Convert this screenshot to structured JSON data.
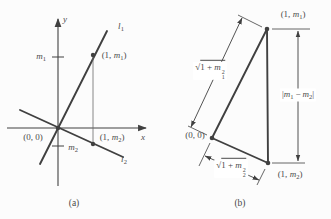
{
  "colors": {
    "ink": "#404040",
    "txt": "#4a4a4a",
    "bg": "#fcfcfc",
    "thin": "#6a6a6a"
  },
  "figure_a": {
    "caption": "(a)",
    "y_axis_label": "y",
    "x_axis_label": "x",
    "l1_label": {
      "letter": "l",
      "sub": "1"
    },
    "l2_label": {
      "letter": "l",
      "sub": "2"
    },
    "m1_tick_label": {
      "letter": "m",
      "sub": "1"
    },
    "m2_tick_label": {
      "letter": "m",
      "sub": "2"
    },
    "origin_label": "(0, 0)",
    "p1_label": {
      "pre": "(1, ",
      "letter": "m",
      "sub": "1",
      "post": ")"
    },
    "p2_label": {
      "pre": "(1, ",
      "letter": "m",
      "sub": "2",
      "post": ")"
    }
  },
  "figure_b": {
    "caption": "(b)",
    "origin_label": "(0, 0)",
    "p1_label": {
      "pre": "(1, ",
      "letter": "m",
      "sub": "1",
      "post": ")"
    },
    "p2_label": {
      "pre": "(1, ",
      "letter": "m",
      "sub": "2",
      "post": ")"
    },
    "side_hyp_top_label": {
      "radical": "√",
      "body": "1 + ",
      "letter": "m",
      "sub": "1",
      "sup": "2"
    },
    "side_hyp_bottom_label": {
      "radical": "√",
      "body": "1 + ",
      "letter": "m",
      "sub": "2",
      "sup": "2"
    },
    "side_vertical_label": {
      "open": "|",
      "letter1": "m",
      "sub1": "1",
      "minus": "−",
      "letter2": "m",
      "sub2": "2",
      "close": "|"
    }
  }
}
